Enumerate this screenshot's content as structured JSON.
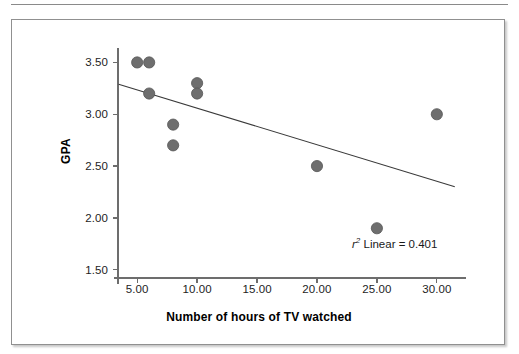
{
  "figure": {
    "has_top_rule": true,
    "has_border": true,
    "border_color": "#909090",
    "background": "#ffffff"
  },
  "chart_data": {
    "type": "scatter",
    "title": "",
    "subtitle": "",
    "xlabel": "Number of hours of TV watched",
    "ylabel": "GPA",
    "xlim": [
      3.4,
      31.6
    ],
    "ylim": [
      1.42,
      3.62
    ],
    "xticks": [
      5,
      10,
      15,
      20,
      25,
      30
    ],
    "xtick_labels": [
      "5.00",
      "10.00",
      "15.00",
      "20.00",
      "25.00",
      "30.00"
    ],
    "yticks": [
      1.5,
      2.0,
      2.5,
      3.0,
      3.5
    ],
    "ytick_labels": [
      "1.50",
      "2.00",
      "2.50",
      "3.00",
      "3.50"
    ],
    "grid": false,
    "legend": null,
    "marker_color": "#6e6e6e",
    "marker_edge_color": "#555555",
    "marker_radius_px": 5.6,
    "line_color": "#3a3a3a",
    "axis_color": "#6d6d6d",
    "points": [
      {
        "x": 5,
        "y": 3.5
      },
      {
        "x": 6,
        "y": 3.5
      },
      {
        "x": 6,
        "y": 3.2
      },
      {
        "x": 8,
        "y": 2.9
      },
      {
        "x": 8,
        "y": 2.7
      },
      {
        "x": 10,
        "y": 3.3
      },
      {
        "x": 10,
        "y": 3.2
      },
      {
        "x": 20,
        "y": 2.5
      },
      {
        "x": 25,
        "y": 1.9
      },
      {
        "x": 30,
        "y": 3.0
      }
    ],
    "x": [
      5,
      6,
      6,
      8,
      8,
      10,
      10,
      20,
      25,
      30
    ],
    "y": [
      3.5,
      3.5,
      3.2,
      2.9,
      2.7,
      3.3,
      3.2,
      2.5,
      1.9,
      3.0
    ],
    "fit_line": {
      "kind": "linear",
      "x_start": 3.45,
      "y_start": 3.29,
      "x_end": 31.5,
      "y_end": 2.3
    },
    "annotations": [
      {
        "name": "r-squared-linear",
        "symbol": "r",
        "exponent": "2",
        "text": " Linear = ",
        "value": "0.401",
        "full_text": "r2 Linear = 0.401"
      }
    ]
  }
}
